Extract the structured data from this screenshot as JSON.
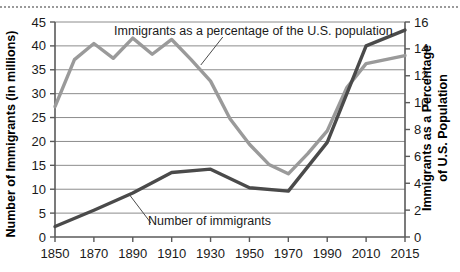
{
  "chart_data": {
    "type": "line",
    "title": "",
    "subtitle": "",
    "xlabel": "",
    "ylabel": "Number of Immigrants (in millions)",
    "y2label": "Immigrants as a Percentage of U.S. Population",
    "xlim": [
      1850,
      2015
    ],
    "ylim": [
      0,
      45
    ],
    "y2lim": [
      0,
      16
    ],
    "yticks": [
      0,
      5,
      10,
      15,
      20,
      25,
      30,
      35,
      40,
      45
    ],
    "y2ticks": [
      0,
      2,
      4,
      6,
      8,
      10,
      12,
      14,
      16
    ],
    "xticks": [
      1850,
      1870,
      1890,
      1910,
      1930,
      1950,
      1970,
      1990,
      2010,
      2015
    ],
    "xtick_labels": [
      "1850",
      "1870",
      "1890",
      "1910",
      "1930",
      "1950",
      "1970",
      "1990",
      "2010",
      "2015"
    ],
    "grid": "horizontal",
    "legend_position": "inline-annotations",
    "series": [
      {
        "name": "Immigrants as a percentage of the U.S. population",
        "axis": "right",
        "color": "#9a9a9a",
        "units": "percent",
        "x": [
          1850,
          1860,
          1870,
          1880,
          1890,
          1900,
          1910,
          1920,
          1930,
          1940,
          1950,
          1960,
          1970,
          1980,
          1990,
          2000,
          2010,
          2015
        ],
        "values": [
          9.7,
          13.2,
          14.4,
          13.3,
          14.8,
          13.6,
          14.7,
          13.2,
          11.6,
          8.8,
          6.9,
          5.4,
          4.7,
          6.2,
          7.9,
          11.1,
          12.9,
          13.5
        ]
      },
      {
        "name": "Number of immigrants",
        "axis": "left",
        "color": "#4a4a4a",
        "units": "millions",
        "x": [
          1850,
          1870,
          1890,
          1910,
          1930,
          1950,
          1970,
          1990,
          2010,
          2015
        ],
        "values": [
          2.2,
          5.6,
          9.2,
          13.5,
          14.2,
          10.3,
          9.6,
          19.8,
          40.0,
          43.3
        ]
      }
    ],
    "annotations": [
      {
        "name": "percentage-series-label",
        "text": "Immigrants as a percentage of the U.S. population",
        "points_to_series": "Immigrants as a percentage of the U.S. population"
      },
      {
        "name": "number-series-label",
        "text": "Number of immigrants",
        "points_to_series": "Number of immigrants"
      }
    ]
  },
  "axes": {
    "left_title": "Number of Immigrants (in millions)",
    "right_title_line1": "Immigrants as a Percentage",
    "right_title_line2": "of U.S. Population"
  },
  "colors": {
    "percentage_line": "#9a9a9a",
    "number_line": "#4a4a4a",
    "gridline": "#8c8c8c",
    "axis": "#5a5a5a",
    "text": "#1a1a1a",
    "background": "#ffffff"
  }
}
